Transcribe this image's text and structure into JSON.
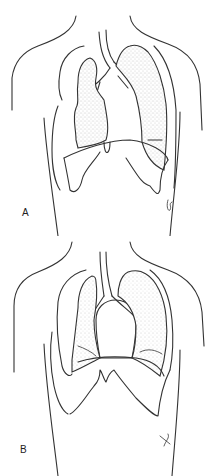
{
  "figure": {
    "panels": [
      {
        "id": "A",
        "label": "A",
        "description": "Chest outline with lungs, trachea and bronchi; diaphragm domes low"
      },
      {
        "id": "B",
        "label": "B",
        "description": "Chest outline with lungs, trachea and bronchi; heart silhouette enlarged, diaphragm raised"
      }
    ],
    "colors": {
      "ink": "#333333",
      "background": "#ffffff",
      "stipple": "#9a9a9a"
    }
  }
}
